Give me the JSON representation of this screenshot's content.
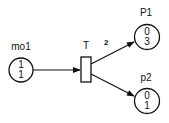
{
  "diagram": {
    "type": "petri-net",
    "places": [
      {
        "id": "mo1",
        "label": "mo1",
        "tokens_top": "1",
        "tokens_bottom": "1"
      },
      {
        "id": "P1",
        "label": "P1",
        "tokens_top": "0",
        "tokens_bottom": "3"
      },
      {
        "id": "p2",
        "label": "p2",
        "tokens_top": "0",
        "tokens_bottom": "1"
      }
    ],
    "transitions": [
      {
        "id": "T",
        "label": "T"
      }
    ],
    "arcs": [
      {
        "from": "mo1",
        "to": "T",
        "weight": ""
      },
      {
        "from": "T",
        "to": "P1",
        "weight": "2"
      },
      {
        "from": "T",
        "to": "p2",
        "weight": ""
      }
    ],
    "colors": {
      "stroke": "#111111",
      "background": "#ffffff"
    }
  }
}
